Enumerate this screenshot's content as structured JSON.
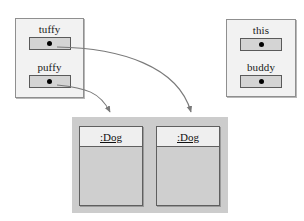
{
  "diagram": {
    "colors": {
      "frame_fill": "#f2f2f2",
      "frame_border": "#8f8f8f",
      "cell_fill": "#d4d4d4",
      "cell_border": "#5a5a5a",
      "dot": "#000000",
      "heap_fill": "#cccccc",
      "object_header_fill": "#efefef",
      "object_body_fill": "#cfcfcf",
      "object_border": "#5f5f5f",
      "arrow": "#7a7a7a",
      "background": "#ffffff"
    }
  },
  "frames": [
    {
      "id": "frame-left",
      "variables": [
        {
          "label": "tuffy",
          "value_kind": "reference-dot"
        },
        {
          "label": "puffy",
          "value_kind": "reference-dot"
        }
      ]
    },
    {
      "id": "frame-right",
      "variables": [
        {
          "label": "this",
          "value_kind": "reference-dot"
        },
        {
          "label": "buddy",
          "value_kind": "reference-dot"
        }
      ]
    }
  ],
  "heap": {
    "objects": [
      {
        "id": "object-dog-1",
        "name": ":Dog",
        "compartments": 2
      },
      {
        "id": "object-dog-2",
        "name": ":Dog",
        "compartments": 2
      }
    ]
  },
  "references": [
    {
      "from": "puffy",
      "to": "object-dog-1"
    },
    {
      "from": "tuffy",
      "to": "object-dog-2"
    }
  ]
}
